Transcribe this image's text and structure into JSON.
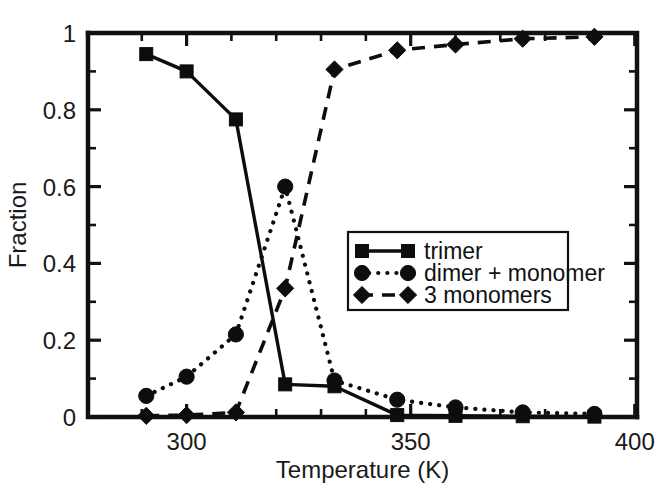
{
  "chart_data": {
    "type": "line",
    "title": "",
    "xlabel": "Temperature (K)",
    "ylabel": "Fraction",
    "xlim": [
      278,
      400.5
    ],
    "ylim": [
      0,
      1
    ],
    "grid": false,
    "legend_position": "center-right",
    "x_ticks_major": [
      300,
      350,
      400
    ],
    "x_tick_labels": [
      "300",
      "350",
      "400"
    ],
    "x_ticks_minor": [
      290,
      310,
      320,
      330,
      340,
      360,
      370,
      380,
      390
    ],
    "y_ticks_major": [
      0,
      0.2,
      0.4,
      0.6,
      0.8,
      1
    ],
    "y_tick_labels": [
      "0",
      "0.2",
      "0.4",
      "0.6",
      "0.8",
      "1"
    ],
    "y_ticks_minor": [
      0.1,
      0.3,
      0.5,
      0.7,
      0.9
    ],
    "x": [
      291,
      300,
      311,
      322,
      333,
      347,
      360,
      375,
      391
    ],
    "series": [
      {
        "name": "trimer",
        "marker": "square",
        "linestyle": "solid",
        "values": [
          0.945,
          0.9,
          0.775,
          0.085,
          0.08,
          0.005,
          0.003,
          0.002,
          0.001
        ]
      },
      {
        "name": "dimer + monomer",
        "marker": "circle",
        "linestyle": "dotted",
        "values": [
          0.055,
          0.105,
          0.215,
          0.6,
          0.095,
          0.045,
          0.025,
          0.012,
          0.008
        ]
      },
      {
        "name": "3 monomers",
        "marker": "diamond",
        "linestyle": "dashed",
        "values": [
          0.003,
          0.005,
          0.012,
          0.335,
          0.905,
          0.955,
          0.97,
          0.985,
          0.99
        ]
      }
    ],
    "colors": {
      "foreground": "#0d0d0d",
      "background": "#ffffff",
      "axis": "#111111"
    }
  }
}
